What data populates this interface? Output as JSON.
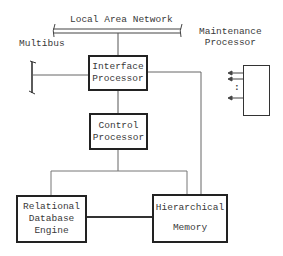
{
  "diagram": {
    "lan_label": "Local Area Network",
    "multibus_label": "Multibus",
    "maintenance_label": [
      "Maintenance",
      "Processor"
    ],
    "nodes": {
      "interface_processor": [
        "Interface",
        "Processor"
      ],
      "control_processor": [
        "Control",
        "Processor"
      ],
      "relational_database_engine": [
        "Relational",
        "Database",
        "Engine"
      ],
      "hierarchical_memory": [
        "Hierarchical",
        "Memory"
      ]
    },
    "maintenance_ellipsis": ":"
  }
}
